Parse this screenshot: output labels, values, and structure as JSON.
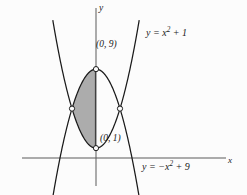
{
  "figure": {
    "background_color": "#fcfcfc",
    "curve_color": "#1a1a1a",
    "axis_color": "#555555",
    "shade_color": "#a8a8a8",
    "marker_fill": "#ffffff"
  },
  "axes": {
    "x_label": "x",
    "y_label": "y",
    "x_axis_pixel_y": 158,
    "y_axis_pixel_x": 96
  },
  "labels": {
    "curve_upper": {
      "prefix": "y = x",
      "exponent": "2",
      "suffix": " + 1"
    },
    "curve_lower": {
      "prefix": "y = −x",
      "exponent": "2",
      "suffix": " + 9"
    },
    "point_top": "(0, 9)",
    "point_bottom": "(0, 1)"
  },
  "chart_data": {
    "type": "line",
    "title": "",
    "xlabel": "x",
    "ylabel": "y",
    "xlim": [
      -5.2,
      10.7
    ],
    "ylim": [
      -3.7,
      16.0
    ],
    "grid": false,
    "legend": "inline-curve-labels",
    "series": [
      {
        "name": "y = x^2 + 1",
        "equation": "y = x^2 + 1",
        "type": "parabola",
        "opens": "up",
        "vertex": [
          0,
          1
        ],
        "coefficient": 1,
        "constant": 1,
        "x_range": [
          -3.6,
          3.6
        ]
      },
      {
        "name": "y = -x^2 + 9",
        "equation": "y = -x^2 + 9",
        "type": "parabola",
        "opens": "down",
        "vertex": [
          0,
          9
        ],
        "coefficient": -1,
        "constant": 9,
        "x_range": [
          -3.6,
          3.6
        ]
      }
    ],
    "marked_points": [
      {
        "label": "(0, 9)",
        "x": 0,
        "y": 9,
        "marker": "open-circle"
      },
      {
        "label": "(0, 1)",
        "x": 0,
        "y": 1,
        "marker": "open-circle"
      },
      {
        "label": "",
        "x": -2,
        "y": 5,
        "marker": "open-circle"
      },
      {
        "label": "",
        "x": 2,
        "y": 5,
        "marker": "open-circle"
      }
    ],
    "intersections": [
      [
        -2,
        5
      ],
      [
        2,
        5
      ]
    ],
    "shaded_region": {
      "description": "vertical representative strip inside the lens bounded by the two parabolas",
      "x_from": -2.0,
      "x_to": -0.05,
      "fill": "#a8a8a8"
    }
  }
}
